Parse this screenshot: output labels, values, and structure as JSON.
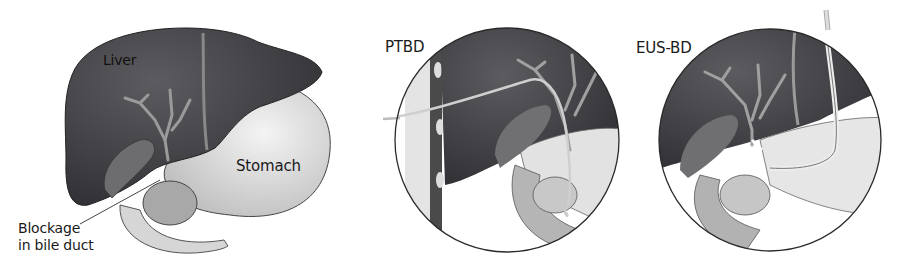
{
  "figure": {
    "panels": [
      {
        "id": "anatomy",
        "labels": {
          "liver": "Liver",
          "stomach": "Stomach",
          "blockage_line1": "Blockage",
          "blockage_line2": "in bile duct"
        }
      },
      {
        "id": "ptbd",
        "title": "PTBD"
      },
      {
        "id": "eusbd",
        "title": "EUS-BD"
      }
    ],
    "colors": {
      "liver": "#3e3e42",
      "liver_highlight": "#5a5a5e",
      "bile_duct": "#8f8f8f",
      "stomach": "#e6e6e6",
      "stomach_shade": "#c4c4c4",
      "outline": "#2a2a2a",
      "text": "#1a1a1a"
    }
  }
}
